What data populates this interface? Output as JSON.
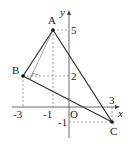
{
  "figure": {
    "axes": {
      "x_label": "x",
      "y_label": "y",
      "origin_label": "O"
    },
    "points": [
      {
        "name": "A",
        "x": -1,
        "y": 5
      },
      {
        "name": "B",
        "x": -3,
        "y": 2
      },
      {
        "name": "C",
        "x": 3,
        "y": -1
      }
    ],
    "x_ticks": [
      "-3",
      "-1",
      "3"
    ],
    "y_ticks": [
      "5",
      "2",
      "-1"
    ],
    "colors": {
      "line": "#333333",
      "dash": "#555555",
      "point": "#111111"
    }
  }
}
